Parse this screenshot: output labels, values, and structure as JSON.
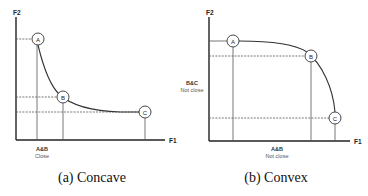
{
  "diagrams": [
    {
      "id": "concave",
      "caption": "(a) Concave",
      "x_axis_label": "F1",
      "y_axis_label": "F2",
      "points": [
        {
          "label": "A"
        },
        {
          "label": "B"
        },
        {
          "label": "C"
        }
      ],
      "annotation": {
        "line1": "A&B",
        "line2": "Close"
      }
    },
    {
      "id": "convex",
      "caption": "(b) Convex",
      "x_axis_label": "F1",
      "y_axis_label": "F2",
      "points": [
        {
          "label": "A"
        },
        {
          "label": "B"
        },
        {
          "label": "C"
        }
      ],
      "annotations": [
        {
          "line1": "A&B",
          "line2": "Not close"
        },
        {
          "line1": "B&C",
          "line2": "Not close"
        }
      ]
    }
  ]
}
